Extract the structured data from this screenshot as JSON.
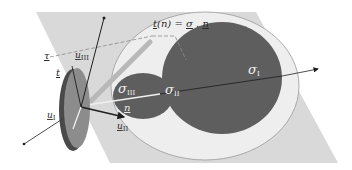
{
  "figure": {
    "colors": {
      "background": "#ffffff",
      "plane": "#d9d9d9",
      "outer_circle": "#ececec",
      "outer_circle_stroke": "#8a8a8a",
      "principal_circles": "#5e5e5e",
      "disk_face": "#8c8c8c",
      "disk_edge": "#4a4a4a",
      "arrow": "#1e1e1e",
      "dashed": "#8a8a8a",
      "text_light": "#f2f2f2",
      "text_dark": "#2a2a2a"
    }
  },
  "labels": {
    "traction": {
      "main": "t",
      "arg": "(n)",
      "eq": " = ",
      "sigma": "σ",
      "dot": " . ",
      "n": "n"
    },
    "tau": "τ",
    "t": "t",
    "u_III": {
      "base": "u",
      "sub": "III"
    },
    "u_II": {
      "base": "u",
      "sub": "II"
    },
    "u_I": {
      "base": "u",
      "sub": "I"
    },
    "n": "n",
    "sigma_I": {
      "base": "σ",
      "sub": "I"
    },
    "sigma_II": {
      "base": "σ",
      "sub": "II"
    },
    "sigma_III": {
      "base": "σ",
      "sub": "III"
    }
  }
}
